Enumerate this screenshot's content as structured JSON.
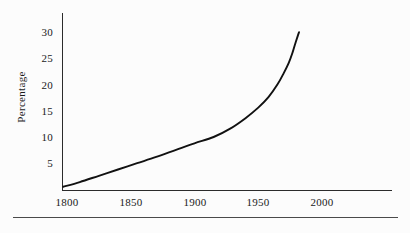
{
  "chart_data": {
    "type": "line",
    "title": "",
    "subtitle": "",
    "xlabel": "",
    "ylabel": "Percentage",
    "xlim": [
      1790,
      2040
    ],
    "ylim": [
      0,
      32
    ],
    "grid": false,
    "legend": null,
    "x_ticks": [
      1800,
      1850,
      1900,
      1950,
      2000
    ],
    "x_tick_labels": [
      "1800",
      "1850",
      "1900",
      "1950",
      "2000"
    ],
    "y_ticks": [
      5,
      10,
      15,
      20,
      25,
      30
    ],
    "y_tick_labels": [
      "5",
      "10",
      "15",
      "20",
      "25",
      "30"
    ],
    "series": [
      {
        "name": "Percentage",
        "color": "#111111",
        "x": [
          1797,
          1810,
          1825,
          1840,
          1855,
          1870,
          1885,
          1900,
          1915,
          1928,
          1940,
          1950,
          1958,
          1965,
          1970,
          1974,
          1977,
          1979,
          1981,
          1982
        ],
        "values": [
          0.5,
          1.4,
          2.6,
          3.8,
          5.0,
          6.2,
          7.5,
          8.8,
          10.0,
          11.6,
          13.6,
          15.6,
          17.6,
          20.0,
          22.2,
          24.2,
          26.2,
          27.8,
          29.3,
          30.0
        ]
      }
    ],
    "annotations": []
  },
  "figure": {
    "background_color": "#fcfcfc",
    "axis_color": "#2b2b2b",
    "text_color": "#1a1a1a",
    "footer_rule_color": "#4a4a4a",
    "ylabel_rotation": "-90"
  }
}
